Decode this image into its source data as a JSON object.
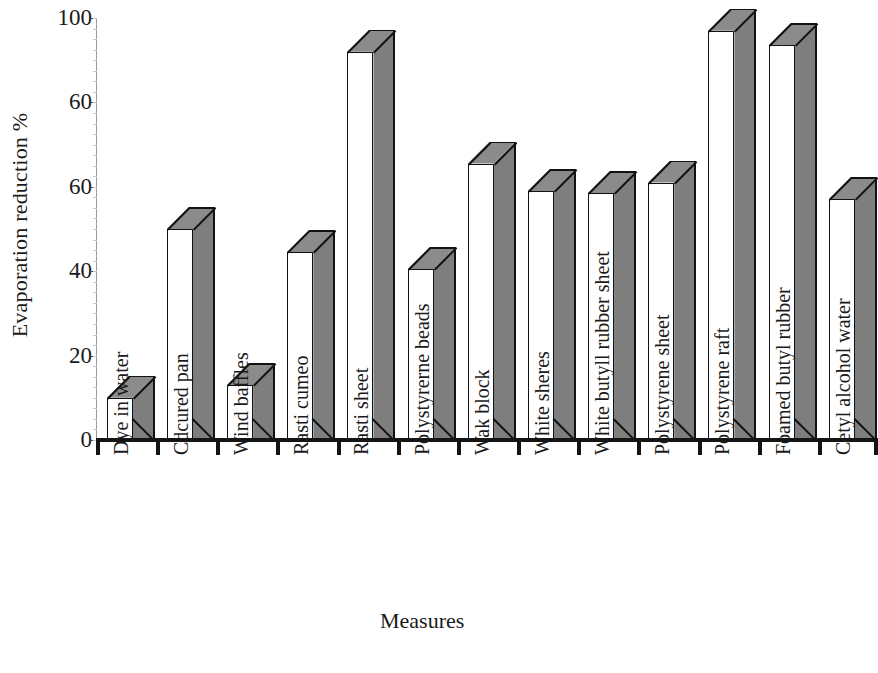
{
  "chart_data": {
    "type": "bar",
    "title": "",
    "xlabel": "Measures",
    "ylabel": "Evaporation reduction %",
    "ylim": [
      0,
      100
    ],
    "grid": false,
    "legend": "none",
    "style": "3d-bars",
    "y_tick_labels": [
      "100",
      "60",
      "60",
      "40",
      "20",
      "0"
    ],
    "y_tick_positions": [
      100,
      80,
      60,
      40,
      20,
      0
    ],
    "categories": [
      "Dye in water",
      "Cdcured pan",
      "Wind baffles",
      "Rasti cumeo",
      "Rasti sheet",
      "Polystyrerne  beads",
      "Wak block",
      "White sheres",
      "White butyll rubber sheet",
      "Polystyrene sheet",
      "Polystyrene raft",
      "Foamed butyl rubber",
      "Cetyl alcohol water"
    ],
    "values": [
      10,
      50,
      13,
      44.5,
      92,
      40.5,
      65.5,
      59,
      58.5,
      61,
      97,
      93.5,
      57
    ],
    "series": [
      {
        "name": "Evaporation reduction %",
        "values": [
          10,
          50,
          13,
          44.5,
          92,
          40.5,
          65.5,
          59,
          58.5,
          61,
          97,
          93.5,
          57
        ]
      }
    ],
    "colors": {
      "bar_front": "#ffffff",
      "bar_side": "#7e7e7e",
      "bar_top": "#8b8b8b",
      "outline": "#121212",
      "axis": "#141414",
      "background": "#ffffff"
    }
  }
}
